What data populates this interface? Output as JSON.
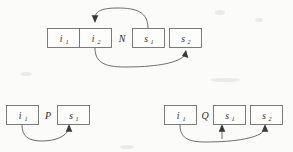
{
  "figure": {
    "background_color": "#fbfbf9",
    "line_color": "#5d5d5d",
    "box_stroke_color": "#6e6e6e",
    "text_color": "#2d2d2d",
    "diagrams": [
      {
        "id": "diagram-n",
        "relation_label": "N",
        "nodes": [
          {
            "id": "n-i1",
            "base": "i",
            "sub": "1",
            "text": "i1"
          },
          {
            "id": "n-i2",
            "base": "i",
            "sub": "2",
            "text": "i2"
          },
          {
            "id": "n-s1",
            "base": "s",
            "sub": "1",
            "text": "s1"
          },
          {
            "id": "n-s2",
            "base": "s",
            "sub": "2",
            "text": "s2"
          }
        ],
        "edges": [
          {
            "id": "n-edge-top",
            "from": "n-s1",
            "to": "n-i2",
            "route": "above",
            "arrow_at": "to"
          },
          {
            "id": "n-edge-bottom",
            "from": "n-i2",
            "to": "n-s2",
            "route": "below",
            "arrow_at": "to"
          }
        ]
      },
      {
        "id": "diagram-p",
        "relation_label": "P",
        "nodes": [
          {
            "id": "p-i1",
            "base": "i",
            "sub": "1",
            "text": "i1"
          },
          {
            "id": "p-s1",
            "base": "s",
            "sub": "1",
            "text": "s1"
          }
        ],
        "edges": [
          {
            "id": "p-edge-bottom",
            "from": "p-i1",
            "to": "p-s1",
            "route": "below",
            "arrow_at": "to"
          }
        ]
      },
      {
        "id": "diagram-q",
        "relation_label": "Q",
        "nodes": [
          {
            "id": "q-i1",
            "base": "i",
            "sub": "1",
            "text": "i1"
          },
          {
            "id": "q-s1",
            "base": "s",
            "sub": "1",
            "text": "s1"
          },
          {
            "id": "q-s2",
            "base": "s",
            "sub": "2",
            "text": "s2"
          }
        ],
        "edges": [
          {
            "id": "q-edge-s1",
            "from": "q-i1",
            "to": "q-s1",
            "route": "below",
            "arrow_at": "to"
          },
          {
            "id": "q-edge-s2",
            "from": "q-i1",
            "to": "q-s2",
            "route": "below",
            "arrow_at": "to"
          }
        ]
      }
    ]
  }
}
